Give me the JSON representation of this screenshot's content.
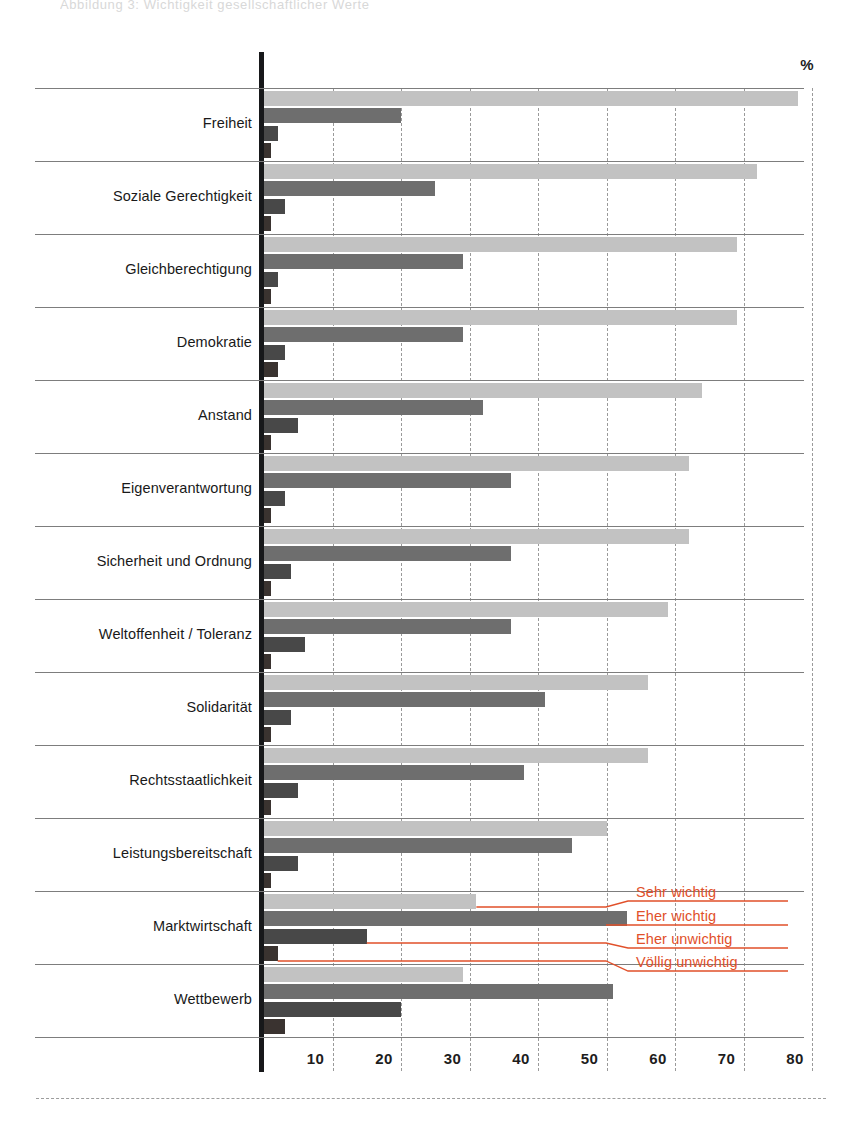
{
  "header": {
    "ghost_line": "Abbildung 3: Wichtigkeit gesellschaftlicher Werte"
  },
  "axis": {
    "unit_label": "%",
    "ticks": [
      "10",
      "20",
      "30",
      "40",
      "50",
      "60",
      "70",
      "80"
    ],
    "tick_values": [
      10,
      20,
      30,
      40,
      50,
      60,
      70,
      80
    ],
    "xmin": 0,
    "xmax": 80
  },
  "legend": {
    "items": [
      {
        "label": "Sehr wichtig",
        "color": "#c2c2c2"
      },
      {
        "label": "Eher wichtig",
        "color": "#6e6e6e"
      },
      {
        "label": "Eher unwichtig",
        "color": "#484848"
      },
      {
        "label": "Völlig unwichtig",
        "color": "#3a3330"
      }
    ],
    "text_color": "#e1502a"
  },
  "chart_data": {
    "type": "bar",
    "orientation": "horizontal",
    "title": "",
    "subtitle": "",
    "xlabel": "%",
    "ylabel": "",
    "xlim": [
      0,
      80
    ],
    "grid": "vertical-dashed",
    "legend_position": "inline-callouts-right",
    "categories": [
      "Freiheit",
      "Soziale Gerechtigkeit",
      "Gleichberechtigung",
      "Demokratie",
      "Anstand",
      "Eigenverantwortung",
      "Sicherheit und Ordnung",
      "Weltoffenheit / Toleranz",
      "Solidarität",
      "Rechtsstaatlichkeit",
      "Leistungsbereitschaft",
      "Marktwirtschaft",
      "Wettbewerb"
    ],
    "series": [
      {
        "name": "Sehr wichtig",
        "color": "#c2c2c2",
        "values": [
          78,
          72,
          69,
          69,
          64,
          62,
          62,
          59,
          56,
          56,
          50,
          31,
          29
        ]
      },
      {
        "name": "Eher wichtig",
        "color": "#6e6e6e",
        "values": [
          20,
          25,
          29,
          29,
          32,
          36,
          36,
          36,
          41,
          38,
          45,
          53,
          51
        ]
      },
      {
        "name": "Eher unwichtig",
        "color": "#484848",
        "values": [
          2,
          3,
          2,
          3,
          5,
          3,
          4,
          6,
          4,
          5,
          5,
          15,
          20
        ]
      },
      {
        "name": "Völlig unwichtig",
        "color": "#3a3330",
        "values": [
          1,
          1,
          1,
          2,
          1,
          1,
          1,
          1,
          1,
          1,
          1,
          2,
          3
        ]
      }
    ]
  }
}
